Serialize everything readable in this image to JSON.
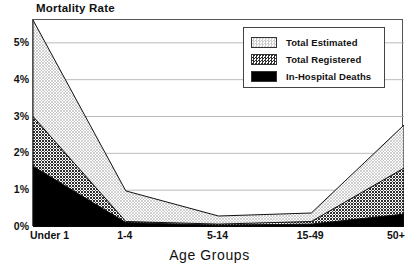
{
  "chart_data": {
    "type": "area",
    "stacked": true,
    "title": "",
    "ylabel": "Mortality Rate",
    "xlabel": "Age Groups",
    "categories": [
      "Under 1",
      "1-4",
      "5-14",
      "15-49",
      "50+"
    ],
    "ytick_labels": [
      "0%",
      "1%",
      "2%",
      "3%",
      "4%",
      "5%"
    ],
    "ytick_values": [
      0,
      1,
      2,
      3,
      4,
      5
    ],
    "ylim": [
      0,
      5.62
    ],
    "grid": "horizontal",
    "legend_position": "top-right",
    "series": [
      {
        "name": "In-Hospital Deaths",
        "fill": "solid-black",
        "color": "#000000",
        "values": [
          1.65,
          0.12,
          0.05,
          0.08,
          0.35
        ]
      },
      {
        "name": "Total Registered",
        "fill": "dark-checker",
        "color": "#3a3a3a",
        "values": [
          1.35,
          0.03,
          0.03,
          0.07,
          1.25
        ]
      },
      {
        "name": "Total Estimated",
        "fill": "light-stipple",
        "color": "#d8d8d8",
        "values": [
          2.62,
          0.83,
          0.22,
          0.23,
          1.17
        ]
      }
    ],
    "cumulative_tops": {
      "In-Hospital Deaths": [
        1.65,
        0.12,
        0.05,
        0.08,
        0.35
      ],
      "Total Registered": [
        3.0,
        0.15,
        0.08,
        0.15,
        1.6
      ],
      "Total Estimated": [
        5.62,
        0.98,
        0.3,
        0.38,
        2.77
      ]
    }
  },
  "axes": {
    "ylabel": "Mortality Rate",
    "xlabel": "Age Groups"
  },
  "legend": {
    "entries": [
      {
        "label": "Total Estimated"
      },
      {
        "label": "Total Registered"
      },
      {
        "label": "In-Hospital Deaths"
      }
    ]
  }
}
